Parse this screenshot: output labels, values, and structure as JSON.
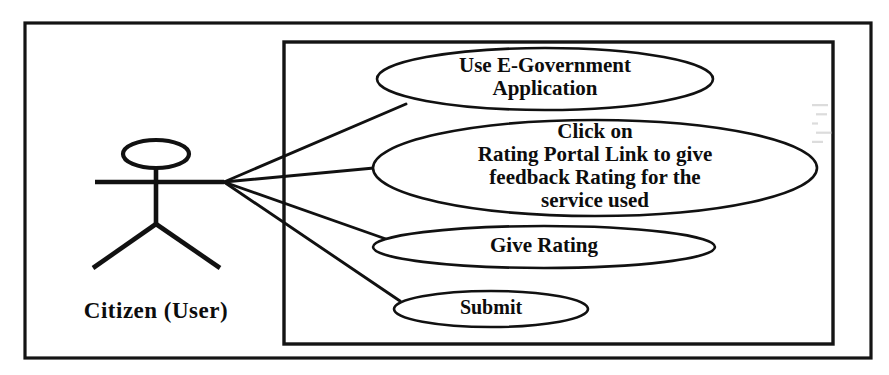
{
  "diagram": {
    "type": "uml-use-case-diagram",
    "background_color": "#ffffff",
    "line_color": "#111111",
    "text_color": "#0d0d0d",
    "outer_frame": {
      "x": 25,
      "y": 23,
      "width": 846,
      "height": 335
    },
    "system_boundary": {
      "x": 284,
      "y": 42,
      "width": 549,
      "height": 302,
      "label": ""
    },
    "actor": {
      "name": "Citizen (User)",
      "label": "Citizen (User)",
      "label_x": 156,
      "label_y": 318,
      "head": {
        "cx": 156,
        "cy": 154,
        "rx": 33,
        "ry": 14
      },
      "body": {
        "x1": 156,
        "y1": 168,
        "x2": 156,
        "y2": 224
      },
      "arms": {
        "x1": 95,
        "y1": 182,
        "x2": 224,
        "y2": 182
      },
      "leg_left": {
        "x1": 156,
        "y1": 224,
        "x2": 93,
        "y2": 268
      },
      "leg_right": {
        "x1": 156,
        "y1": 224,
        "x2": 220,
        "y2": 268
      },
      "hand_point": {
        "x": 224,
        "y": 182
      }
    },
    "use_cases": [
      {
        "id": "use-e-government-application",
        "lines": [
          "Use E-Government",
          "Application"
        ],
        "cx": 545,
        "cy": 79,
        "rx": 168,
        "ry": 31,
        "font_size": 21,
        "line_gap": 23
      },
      {
        "id": "click-on-rating-portal-link",
        "lines": [
          "Click on",
          "Rating Portal Link to give",
          "feedback Rating for the",
          "service used"
        ],
        "cx": 595,
        "cy": 168,
        "rx": 222,
        "ry": 48,
        "font_size": 21,
        "line_gap": 23
      },
      {
        "id": "give-rating",
        "lines": [
          "Give Rating"
        ],
        "cx": 544,
        "cy": 247,
        "rx": 171,
        "ry": 21,
        "font_size": 21,
        "line_gap": 23
      },
      {
        "id": "submit",
        "lines": [
          "Submit"
        ],
        "cx": 491,
        "cy": 309,
        "rx": 97,
        "ry": 18,
        "font_size": 20,
        "line_gap": 23
      }
    ],
    "associations": [
      {
        "id": "actor-to-use-e-government-application",
        "x1": 224,
        "y1": 182,
        "x2": 406,
        "y2": 104
      },
      {
        "id": "actor-to-click-on-rating-portal-link",
        "x1": 224,
        "y1": 182,
        "x2": 374,
        "y2": 168
      },
      {
        "id": "actor-to-give-rating",
        "x1": 224,
        "y1": 182,
        "x2": 386,
        "y2": 239
      },
      {
        "id": "actor-to-submit",
        "x1": 224,
        "y1": 182,
        "x2": 400,
        "y2": 301
      }
    ],
    "artifacts": [
      {
        "id": "scan-smudge",
        "x": 812,
        "y": 104,
        "width": 16,
        "height": 46
      }
    ]
  }
}
